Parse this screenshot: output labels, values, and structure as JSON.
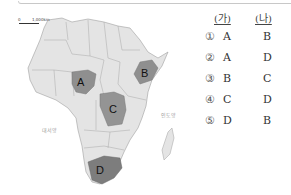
{
  "map": {
    "scale": {
      "zero": "0",
      "distance": "1,000km"
    },
    "oceans": {
      "atlantic": "대서양",
      "indian": "인도양"
    },
    "regions": [
      {
        "label": "A",
        "country_shape": "Nigeria",
        "shaded": true
      },
      {
        "label": "B",
        "country_shape": "Ethiopia",
        "shaded": true
      },
      {
        "label": "C",
        "country_shape": "Democratic Republic of the Congo",
        "shaded": true
      },
      {
        "label": "D",
        "country_shape": "South Africa",
        "shaded": true
      }
    ],
    "colors": {
      "land": "#e2e2e2",
      "border": "#9a9a9a",
      "highlight": "#8f8f8f",
      "highlight_dark": "#7a7a7a"
    }
  },
  "answers": {
    "headers": {
      "ga": "(가)",
      "na": "(나)"
    },
    "rows": [
      {
        "num": "①",
        "ga": "A",
        "na": "B"
      },
      {
        "num": "②",
        "ga": "A",
        "na": "D"
      },
      {
        "num": "③",
        "ga": "B",
        "na": "C"
      },
      {
        "num": "④",
        "ga": "C",
        "na": "D"
      },
      {
        "num": "⑤",
        "ga": "D",
        "na": "B"
      }
    ]
  }
}
